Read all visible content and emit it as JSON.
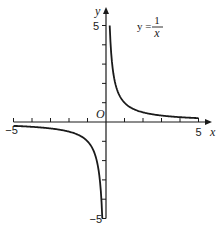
{
  "chart_data": {
    "type": "line",
    "title": "",
    "annotation": "y = 1/x",
    "equation": {
      "lhs": "y =",
      "numerator": "1",
      "denominator": "x"
    },
    "xlabel": "x",
    "ylabel": "y",
    "origin_label": "O",
    "xlim": [
      -5,
      5
    ],
    "ylim": [
      -5,
      5
    ],
    "x_ticks": [
      -5,
      -4,
      -3,
      -2,
      -1,
      0,
      1,
      2,
      3,
      4,
      5
    ],
    "y_ticks": [
      -5,
      -4,
      -3,
      -2,
      -1,
      0,
      1,
      2,
      3,
      4,
      5
    ],
    "x_tick_labels": {
      "-5": "−5",
      "5": "5"
    },
    "y_tick_labels": {
      "5": "5",
      "-5": "−5"
    },
    "grid": false,
    "legend": null,
    "series": [
      {
        "name": "y = 1/x (x > 0)",
        "x": [
          0.2,
          0.25,
          0.33,
          0.5,
          0.75,
          1,
          1.5,
          2,
          2.5,
          3,
          3.5,
          4,
          4.5,
          5
        ],
        "y": [
          5,
          4,
          3,
          2,
          1.33,
          1,
          0.67,
          0.5,
          0.4,
          0.33,
          0.29,
          0.25,
          0.22,
          0.2
        ]
      },
      {
        "name": "y = 1/x (x < 0)",
        "x": [
          -5,
          -4.5,
          -4,
          -3.5,
          -3,
          -2.5,
          -2,
          -1.5,
          -1,
          -0.75,
          -0.5,
          -0.33,
          -0.25,
          -0.2
        ],
        "y": [
          -0.2,
          -0.22,
          -0.25,
          -0.29,
          -0.33,
          -0.4,
          -0.5,
          -0.67,
          -1,
          -1.33,
          -2,
          -3,
          -4,
          -5
        ]
      }
    ]
  }
}
